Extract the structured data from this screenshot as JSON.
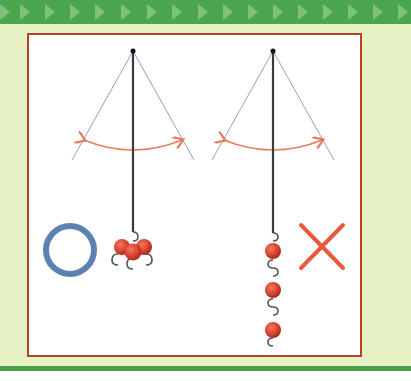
{
  "figure": {
    "colors": {
      "banner": "#4aa54e",
      "banner_arrows": "#7cc27a",
      "panel_bg": "#e6f2c4",
      "frame_border": "#b5452a",
      "swing_lines": "#8fa3c9",
      "swing_arrow": "#ec7a5c",
      "string": "#3a3a3a",
      "weight": "#d9402b",
      "correct_mark": "#5b82b3",
      "wrong_mark": "#ea5a3a"
    },
    "left_pendulum": {
      "label": "weights bundled together",
      "verdict": "correct",
      "mark": "circle-mark",
      "weight_count": 3
    },
    "right_pendulum": {
      "label": "weights linked in a chain",
      "verdict": "incorrect",
      "mark": "cross-mark",
      "weight_count": 3
    }
  }
}
